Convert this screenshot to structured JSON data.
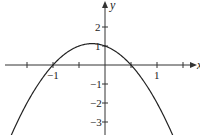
{
  "chart_data": {
    "type": "line",
    "title": "",
    "xlabel": "x",
    "ylabel": "y",
    "function": "y = -2x^2 - x + 1",
    "xlim": [
      -2,
      1.85
    ],
    "ylim": [
      -3.6,
      3.3
    ],
    "x_ticks": [
      -1.5,
      -1,
      -0.5,
      0,
      0.5,
      1,
      1.5
    ],
    "x_tick_labels": [
      {
        "value": -1,
        "label": "−1"
      },
      {
        "value": 1,
        "label": "1"
      }
    ],
    "y_ticks": [
      -3,
      -2,
      -1,
      1,
      2
    ],
    "y_tick_labels": [
      {
        "value": 2,
        "label": "2"
      },
      {
        "value": 1,
        "label": "1"
      },
      {
        "value": -1,
        "label": "−1"
      },
      {
        "value": -2,
        "label": "−2"
      },
      {
        "value": -3,
        "label": "−3"
      }
    ],
    "series": [
      {
        "name": "parabola",
        "x": [
          -1.8,
          -1.5,
          -1,
          -0.5,
          -0.25,
          0,
          0.5,
          1,
          1.3
        ],
        "y": [
          -3.68,
          -2,
          0,
          1,
          1.125,
          1,
          0,
          -2,
          -3.68
        ]
      }
    ],
    "key_points": {
      "x_intercepts": [
        -1,
        0.5
      ],
      "y_intercept": 1,
      "vertex": [
        -0.25,
        1.125
      ]
    },
    "grid": false,
    "legend": null
  },
  "labels": {
    "x_axis": "x",
    "y_axis": "y",
    "x_neg1": "−1",
    "x_pos1": "1",
    "y_2": "2",
    "y_1": "1",
    "y_neg1": "−1",
    "y_neg2": "−2",
    "y_neg3": "−3"
  },
  "colors": {
    "curve": "#222222",
    "axes": "#333333"
  }
}
